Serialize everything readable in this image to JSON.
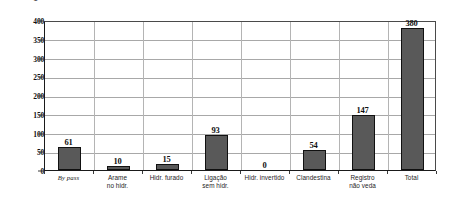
{
  "chart_data": {
    "type": "bar",
    "title": "",
    "subtitle": "",
    "xlabel": "",
    "ylabel": "QTD",
    "ylim": [
      0,
      400
    ],
    "ytick_step": 50,
    "yticks": [
      "400",
      "350",
      "300",
      "250",
      "200",
      "150",
      "100",
      "50",
      "0"
    ],
    "grid": true,
    "legend": false,
    "legend_position": "none",
    "categories": [
      "By pass",
      "Arame no hidr.",
      "Hidr. furado",
      "Ligação sem hidr.",
      "Hidr. invertido",
      "Clandestina",
      "Registro não veda",
      "Total"
    ],
    "category_lines": [
      [
        "By pass"
      ],
      [
        "Arame",
        "no hidr."
      ],
      [
        "Hidr. furado"
      ],
      [
        "Ligação",
        "sem hidr."
      ],
      [
        "Hidr. invertido"
      ],
      [
        "Clandestina"
      ],
      [
        "Registro",
        "não veda"
      ],
      [
        "Total"
      ]
    ],
    "values": [
      61,
      10,
      15,
      93,
      0,
      54,
      147,
      380
    ],
    "value_labels": [
      "61",
      "10",
      "15",
      "93",
      "0",
      "54",
      "147",
      "380"
    ],
    "colors": {
      "bar_fill": "#595959",
      "bar_border": "#111111",
      "gridline": "#a8a8a8",
      "axis": "#1a1a1a",
      "text": "#111111",
      "background": "#ffffff"
    }
  }
}
